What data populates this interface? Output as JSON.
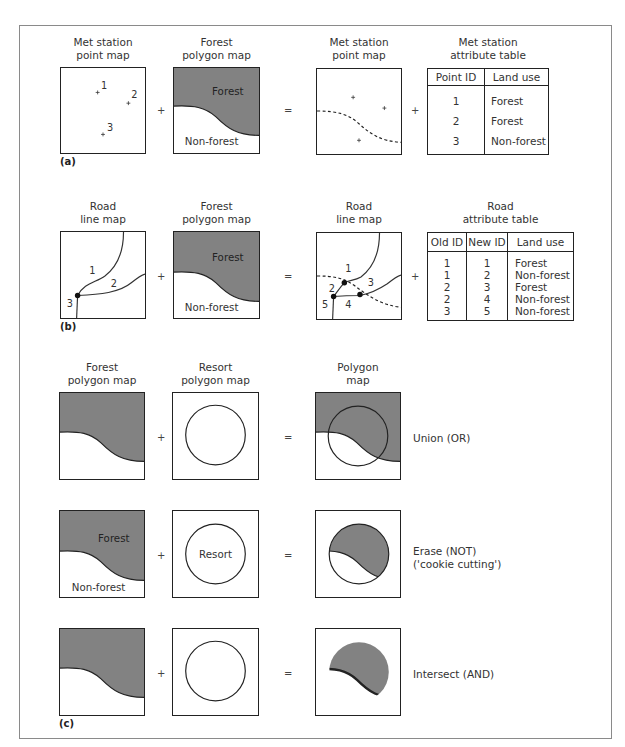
{
  "colors": {
    "forest_fill": "#828282",
    "line": "#222222",
    "frame": "#8a8a8a",
    "background": "#ffffff"
  },
  "operators": {
    "plus": "+",
    "equals": "="
  },
  "panel_a": {
    "label": "(a)",
    "map1": {
      "title_line1": "Met station",
      "title_line2": "point map",
      "points": [
        "1",
        "2",
        "3"
      ]
    },
    "map2": {
      "title_line1": "Forest",
      "title_line2": "polygon map",
      "forest_label": "Forest",
      "nonforest_label": "Non-forest"
    },
    "map3": {
      "title_line1": "Met station",
      "title_line2": "point map"
    },
    "table": {
      "title_line1": "Met station",
      "title_line2": "attribute table",
      "headers": [
        "Point ID",
        "Land use"
      ],
      "rows": [
        {
          "id": "1",
          "land_use": "Forest"
        },
        {
          "id": "2",
          "land_use": "Forest"
        },
        {
          "id": "3",
          "land_use": "Non-forest"
        }
      ]
    }
  },
  "panel_b": {
    "label": "(b)",
    "map1": {
      "title_line1": "Road",
      "title_line2": "line map",
      "segments": [
        "1",
        "2",
        "3"
      ]
    },
    "map2": {
      "title_line1": "Forest",
      "title_line2": "polygon map",
      "forest_label": "Forest",
      "nonforest_label": "Non-forest"
    },
    "map3": {
      "title_line1": "Road",
      "title_line2": "line map",
      "segments": [
        "1",
        "2",
        "3",
        "4",
        "5"
      ]
    },
    "table": {
      "title_line1": "Road",
      "title_line2": "attribute table",
      "headers": [
        "Old ID",
        "New ID",
        "Land use"
      ],
      "rows": [
        {
          "old_id": "1",
          "new_id": "1",
          "land_use": "Forest"
        },
        {
          "old_id": "1",
          "new_id": "2",
          "land_use": "Non-forest"
        },
        {
          "old_id": "2",
          "new_id": "3",
          "land_use": "Forest"
        },
        {
          "old_id": "2",
          "new_id": "4",
          "land_use": "Non-forest"
        },
        {
          "old_id": "3",
          "new_id": "5",
          "land_use": "Non-forest"
        }
      ]
    }
  },
  "panel_c": {
    "label": "(c)",
    "col1": {
      "title_line1": "Forest",
      "title_line2": "polygon map"
    },
    "col2": {
      "title_line1": "Resort",
      "title_line2": "polygon map"
    },
    "col3": {
      "title_line1": "Polygon",
      "title_line2": "map"
    },
    "row2_labels": {
      "forest": "Forest",
      "nonforest": "Non-forest",
      "resort": "Resort"
    },
    "operations": [
      {
        "line1": "Union (OR)",
        "line2": ""
      },
      {
        "line1": "Erase (NOT)",
        "line2": "('cookie cutting')"
      },
      {
        "line1": "Intersect (AND)",
        "line2": ""
      }
    ]
  }
}
